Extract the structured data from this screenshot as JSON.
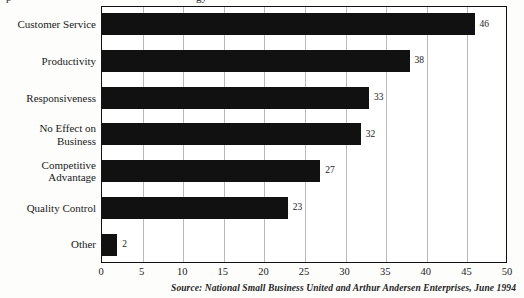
{
  "title_fragments": {
    "left": "p",
    "right": "gy"
  },
  "source_note": "Source: National Small Business United and Arthur Andersen Enterprises, June 1994",
  "axis": {
    "ticks": [
      0,
      5,
      10,
      15,
      20,
      25,
      30,
      35,
      40,
      45,
      50
    ]
  },
  "chart_data": {
    "type": "bar",
    "orientation": "horizontal",
    "title": "",
    "xlabel": "",
    "ylabel": "",
    "xlim": [
      0,
      50
    ],
    "grid": true,
    "legend": false,
    "bar_color": "#111111",
    "categories": [
      "Customer Service",
      "Productivity",
      "Responsiveness",
      "No Effect on\nBusiness",
      "Competitive\nAdvantage",
      "Quality Control",
      "Other"
    ],
    "values": [
      46,
      38,
      33,
      32,
      27,
      23,
      2
    ],
    "value_labels": [
      "46",
      "38",
      "33",
      "32",
      "27",
      "23",
      "2"
    ],
    "tick_labels": [
      "0",
      "5",
      "10",
      "15",
      "20",
      "25",
      "30",
      "35",
      "40",
      "45",
      "50"
    ],
    "annotations": [
      "Source: National Small Business United and Arthur Andersen Enterprises, June 1994"
    ]
  }
}
